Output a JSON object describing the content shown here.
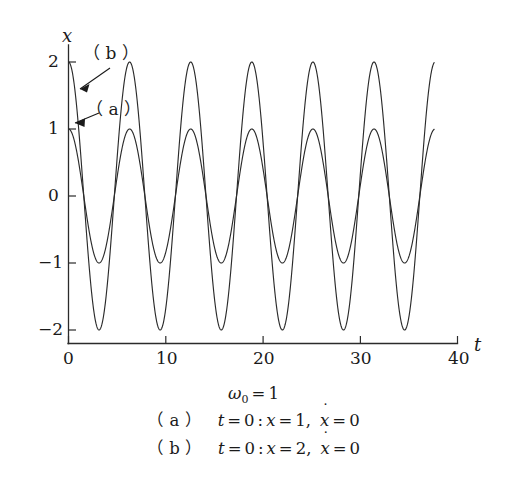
{
  "chart_data": {
    "type": "line",
    "title": "",
    "xlabel": "t",
    "ylabel": "x",
    "xlim": [
      0,
      40
    ],
    "ylim": [
      -2.35,
      2.35
    ],
    "xticks": [
      0,
      10,
      20,
      30,
      40
    ],
    "xtick_labels": [
      "0",
      "10",
      "20",
      "30",
      "40"
    ],
    "yticks": [
      2,
      1,
      0,
      -1,
      -2
    ],
    "ytick_labels": [
      "2",
      "1",
      "0",
      "-1",
      "-2"
    ],
    "grid": false,
    "legend_position": "inline-annotations",
    "x_domain_drawn": [
      0,
      37.6
    ],
    "series": [
      {
        "name": "(a)",
        "formula": "x = 1 * cos(t)",
        "amplitude": 1,
        "omega": 1,
        "phase": 0,
        "initial_x": 1,
        "initial_xdot": 0,
        "annotation_label": "( a )"
      },
      {
        "name": "(b)",
        "formula": "x = 2 * cos(t)",
        "amplitude": 2,
        "omega": 1,
        "phase": 0,
        "initial_x": 2,
        "initial_xdot": 0,
        "annotation_label": "( b )"
      }
    ],
    "annotations": [
      {
        "label": "( b )",
        "points_to_x": 0.55,
        "points_to_y": 1.62
      },
      {
        "label": "( a )",
        "points_to_x": 0.35,
        "points_to_y": 0.92
      }
    ]
  },
  "axes": {
    "y_name": "x",
    "x_name": "t",
    "y_tick_labels": [
      "2",
      "1",
      "0",
      "−1",
      "−2"
    ],
    "x_tick_labels": [
      "0",
      "10",
      "20",
      "30",
      "40"
    ]
  },
  "annotations": {
    "label_b": "（ b ）",
    "label_a": "（ a ）"
  },
  "caption": {
    "omega_symbol": "ω",
    "omega_subscript": "0",
    "omega_equals": "=",
    "omega_value": "1",
    "line_a": {
      "tag": "（ a ）",
      "t_sym": "t",
      "eq1": "=",
      "t_val": "0",
      "colon": ":",
      "x_sym": "x",
      "eq2": "=",
      "x_val": "1,",
      "xdot_sym": "x",
      "eq3": "=",
      "xdot_val": "0"
    },
    "line_b": {
      "tag": "（ b ）",
      "t_sym": "t",
      "eq1": "=",
      "t_val": "0",
      "colon": ":",
      "x_sym": "x",
      "eq2": "=",
      "x_val": "2,",
      "xdot_sym": "x",
      "eq3": "=",
      "xdot_val": "0"
    }
  },
  "colors": {
    "ink": "#2b2b2b",
    "background": "#ffffff"
  }
}
